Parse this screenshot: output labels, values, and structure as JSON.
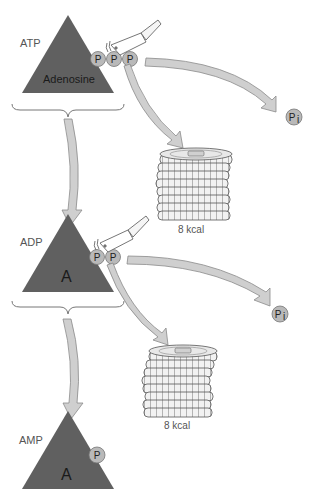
{
  "colors": {
    "triangle": "#606060",
    "phosphate": "#b9b9b9",
    "arrow_fill": "#cfcfcf",
    "arrow_stroke": "#8a8a8a",
    "text": "#555555"
  },
  "stages": [
    {
      "label": "ATP",
      "base_label": "Adenosine",
      "phosphates": [
        "P",
        "P",
        "P"
      ]
    },
    {
      "label": "ADP",
      "base_label": "A",
      "phosphates": [
        "P",
        "P"
      ]
    },
    {
      "label": "AMP",
      "base_label": "A",
      "phosphates": [
        "P"
      ]
    }
  ],
  "releases": [
    {
      "product": "Pi",
      "product_main": "P",
      "product_sub": "i",
      "energy": "8 kcal"
    },
    {
      "product": "Pi",
      "product_main": "P",
      "product_sub": "i",
      "energy": "8 kcal"
    }
  ],
  "icons": {
    "cleaver": "cleaver-icon",
    "coins": "coin-stack-icon"
  }
}
